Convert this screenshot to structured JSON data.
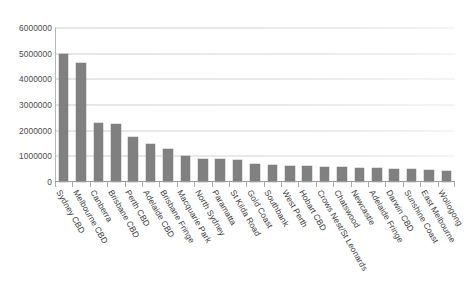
{
  "chart_data": {
    "type": "bar",
    "title": "",
    "subtitle": "",
    "xlabel": "",
    "ylabel": "",
    "ylim": [
      0,
      6000000
    ],
    "grid": true,
    "legend": false,
    "legend_position": "none",
    "bar_color": "#808080",
    "gridline_color": "#e2e2e2",
    "axis_color": "#9a9a9a",
    "ytick_labels": [
      "6000000",
      "5000000",
      "4000000",
      "3000000",
      "2000000",
      "1000000",
      "0"
    ],
    "ytick_values": [
      6000000,
      5000000,
      4000000,
      3000000,
      2000000,
      1000000,
      0
    ],
    "categories": [
      "Sydney CBD",
      "Melbourne CBD",
      "Canberra",
      "Brisbane CBD",
      "Perth CBD",
      "Adelaide CBD",
      "Brisbane Fringe",
      "Macquarie Park",
      "North Sydney",
      "Paramatta",
      "St Kilda Road",
      "Gold Coast",
      "Southbank",
      "West Perth",
      "Hobart CBD",
      "Crows Nest/St Leonards",
      "Chatswood",
      "Newcastle",
      "Adelaide Fringe",
      "Darwin CBD",
      "Sunshine Coast",
      "East Melbourne",
      "Wollogong"
    ],
    "values": [
      5000000,
      4650000,
      2300000,
      2250000,
      1750000,
      1500000,
      1300000,
      1000000,
      900000,
      880000,
      850000,
      700000,
      660000,
      640000,
      620000,
      600000,
      580000,
      560000,
      540000,
      520000,
      500000,
      480000,
      420000
    ]
  }
}
